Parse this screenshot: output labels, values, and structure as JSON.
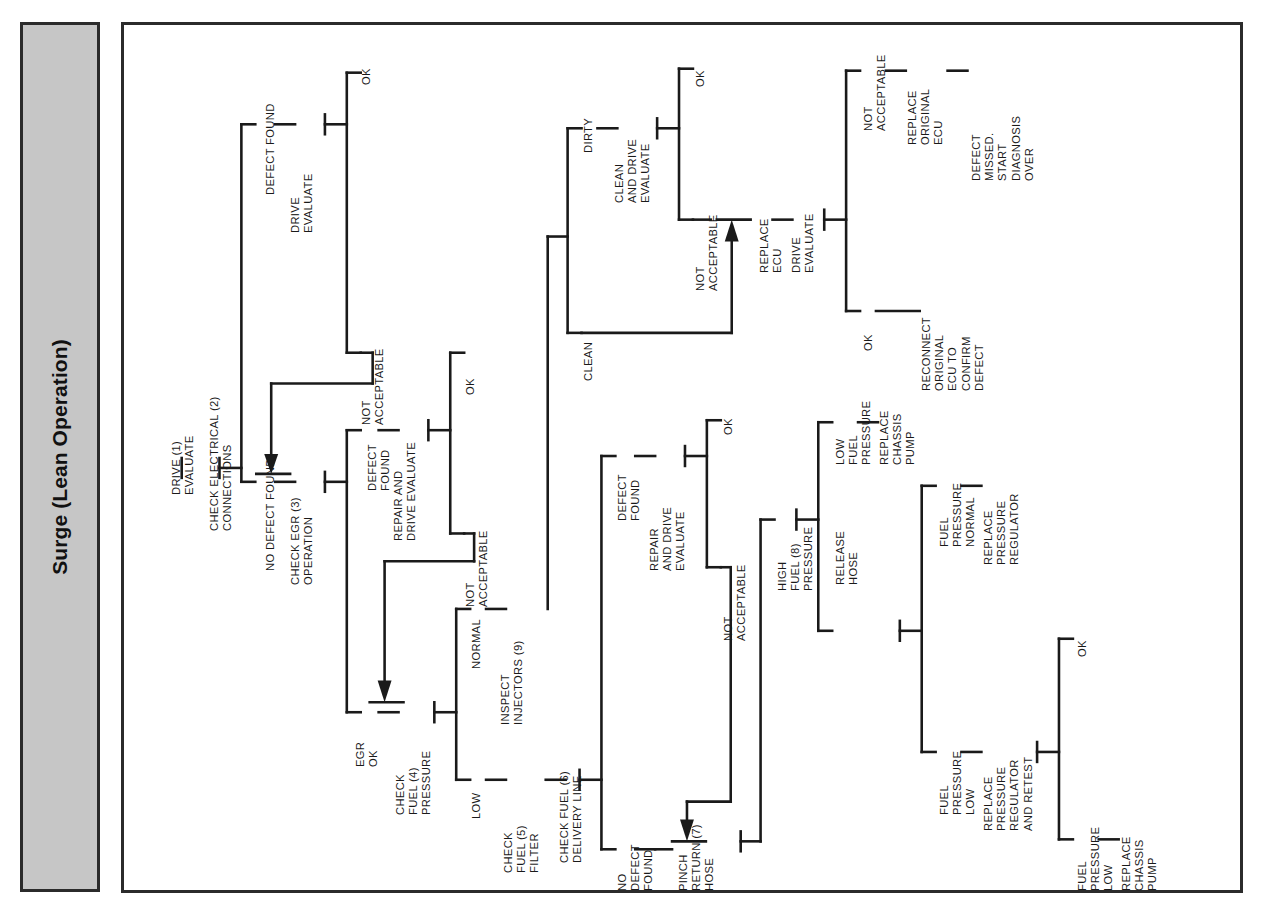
{
  "title": {
    "text": "Surge (Lean Operation)"
  },
  "diagram": {
    "type": "decision-tree-flowchart",
    "orientation": "rotated-90-ccw",
    "colors": {
      "band_fill": "#c6c6c6",
      "border": "#2b2b2b",
      "line": "#1a1a1a",
      "text": "#1a1a1a"
    },
    "nodes": [
      {
        "id": "n1",
        "label": "DRIVE (1)\nEVALUATE"
      },
      {
        "id": "n2",
        "label": "CHECK ELECTRICAL (2)\nCONNECTIONS"
      },
      {
        "id": "n3",
        "label": "DEFECT FOUND"
      },
      {
        "id": "n4",
        "label": "DRIVE\nEVALUATE"
      },
      {
        "id": "n5",
        "label": "OK"
      },
      {
        "id": "n6",
        "label": "NOT\nACCEPTABLE"
      },
      {
        "id": "n7",
        "label": "NO DEFECT FOUND"
      },
      {
        "id": "n8",
        "label": "CHECK EGR (3)\nOPERATION"
      },
      {
        "id": "n9",
        "label": "DEFECT\nFOUND"
      },
      {
        "id": "n10",
        "label": "REPAIR AND\nDRIVE EVALUATE"
      },
      {
        "id": "n11",
        "label": "OK"
      },
      {
        "id": "n12",
        "label": "NOT\nACCEPTABLE"
      },
      {
        "id": "n13",
        "label": "EGR\nOK"
      },
      {
        "id": "n14",
        "label": "CHECK\nFUEL (4)\nPRESSURE"
      },
      {
        "id": "n15",
        "label": "NORMAL"
      },
      {
        "id": "n16",
        "label": "INSPECT\nINJECTORS (9)"
      },
      {
        "id": "n17",
        "label": "LOW"
      },
      {
        "id": "n18",
        "label": "CHECK\nFUEL (5)\nFILTER"
      },
      {
        "id": "n19",
        "label": "CHECK FUEL (6)\nDELIVERY LINE"
      },
      {
        "id": "n20",
        "label": "DEFECT\nFOUND"
      },
      {
        "id": "n21",
        "label": "REPAIR\nAND DRIVE\nEVALUATE"
      },
      {
        "id": "n22",
        "label": "OK"
      },
      {
        "id": "n23",
        "label": "NOT\nACCEPTABLE"
      },
      {
        "id": "n24",
        "label": "NO\nDEFECT\nFOUND"
      },
      {
        "id": "n25",
        "label": "PINCH\nRETURN (7)\nHOSE"
      },
      {
        "id": "n26",
        "label": "HIGH\nFUEL (8)\nPRESSURE"
      },
      {
        "id": "n27",
        "label": "RELEASE\nHOSE"
      },
      {
        "id": "n28",
        "label": "FUEL\nPRESSURE\nNORMAL"
      },
      {
        "id": "n29",
        "label": "REPLACE\nPRESSURE\nREGULATOR"
      },
      {
        "id": "n30",
        "label": "FUEL\nPRESSURE\nLOW"
      },
      {
        "id": "n31",
        "label": "REPLACE\nPRESSURE\nREGULATOR\nAND RETEST"
      },
      {
        "id": "n32",
        "label": "OK"
      },
      {
        "id": "n33",
        "label": "FUEL\nPRESSURE\nLOW"
      },
      {
        "id": "n34",
        "label": "REPLACE\nCHASSIS\nPUMP"
      },
      {
        "id": "n35",
        "label": "LOW\nFUEL\nPRESSURE"
      },
      {
        "id": "n36",
        "label": "REPLACE\nCHASSIS\nPUMP"
      },
      {
        "id": "n37",
        "label": "DIRTY"
      },
      {
        "id": "n38",
        "label": "CLEAN\nAND DRIVE\nEVALUATE"
      },
      {
        "id": "n39",
        "label": "OK"
      },
      {
        "id": "n40",
        "label": "NOT\nACCEPTABLE"
      },
      {
        "id": "n41",
        "label": "CLEAN"
      },
      {
        "id": "n42",
        "label": "REPLACE\nECU"
      },
      {
        "id": "n43",
        "label": "DRIVE\nEVALUATE"
      },
      {
        "id": "n44",
        "label": "NOT\nACCEPTABLE"
      },
      {
        "id": "n45",
        "label": "REPLACE\nORIGINAL\nECU"
      },
      {
        "id": "n46",
        "label": "DEFECT\nMISSED.\nSTART\nDIAGNOSIS\nOVER"
      },
      {
        "id": "n47",
        "label": "OK"
      },
      {
        "id": "n48",
        "label": "RECONNECT\nORIGINAL\nECU TO\nCONFIRM\nDEFECT"
      }
    ]
  }
}
